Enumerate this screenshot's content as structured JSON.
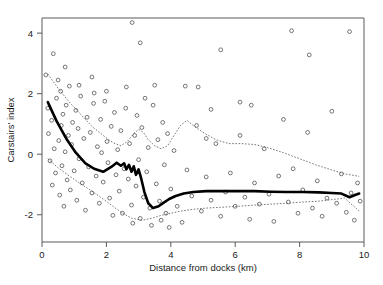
{
  "chart_data": {
    "type": "scatter",
    "title": "",
    "xlabel": "Distance from docks (km)",
    "ylabel": "Carstairs' index",
    "xlim": [
      0,
      10
    ],
    "ylim": [
      -2.9,
      4.5
    ],
    "xticks": [
      0,
      2,
      4,
      6,
      8,
      10
    ],
    "xtick_labels": [
      "0",
      "2",
      "4",
      "6",
      "8",
      "10"
    ],
    "yticks": [
      -2,
      0,
      2,
      4
    ],
    "ytick_labels": [
      "-2",
      "0",
      "2",
      "4"
    ],
    "grid": false,
    "legend": "none",
    "marker": "open-circle",
    "points": [
      [
        0.12,
        2.62
      ],
      [
        0.18,
        1.52
      ],
      [
        0.2,
        0.68
      ],
      [
        0.25,
        -0.22
      ],
      [
        0.3,
        1.12
      ],
      [
        0.32,
        -1.02
      ],
      [
        0.35,
        3.32
      ],
      [
        0.38,
        0.18
      ],
      [
        0.42,
        -0.62
      ],
      [
        0.45,
        1.85
      ],
      [
        0.5,
        2.45
      ],
      [
        0.52,
        0.45
      ],
      [
        0.55,
        -1.35
      ],
      [
        0.58,
        2.08
      ],
      [
        0.6,
        0.95
      ],
      [
        0.62,
        -0.38
      ],
      [
        0.65,
        1.32
      ],
      [
        0.68,
        -1.72
      ],
      [
        0.72,
        0.08
      ],
      [
        0.75,
        1.62
      ],
      [
        0.78,
        -0.85
      ],
      [
        0.82,
        0.62
      ],
      [
        0.85,
        2.25
      ],
      [
        0.88,
        -1.18
      ],
      [
        0.92,
        0.32
      ],
      [
        0.95,
        1.05
      ],
      [
        1.0,
        -0.55
      ],
      [
        1.05,
        1.45
      ],
      [
        1.08,
        -1.52
      ],
      [
        1.12,
        0.85
      ],
      [
        1.15,
        -0.15
      ],
      [
        1.2,
        1.92
      ],
      [
        1.25,
        -0.95
      ],
      [
        1.3,
        0.52
      ],
      [
        1.35,
        -1.85
      ],
      [
        1.4,
        1.22
      ],
      [
        1.45,
        -0.42
      ],
      [
        1.5,
        0.72
      ],
      [
        1.55,
        -1.28
      ],
      [
        1.6,
        1.68
      ],
      [
        1.62,
        2.02
      ],
      [
        1.68,
        -0.72
      ],
      [
        1.72,
        0.25
      ],
      [
        1.78,
        -1.62
      ],
      [
        1.82,
        1.15
      ],
      [
        1.85,
        0.05
      ],
      [
        1.9,
        -0.92
      ],
      [
        1.95,
        1.75
      ],
      [
        2.0,
        2.08
      ],
      [
        2.02,
        0.42
      ],
      [
        2.05,
        -0.28
      ],
      [
        2.1,
        -1.45
      ],
      [
        2.15,
        0.92
      ],
      [
        2.2,
        -2.02
      ],
      [
        2.25,
        1.38
      ],
      [
        2.3,
        -0.68
      ],
      [
        2.35,
        0.15
      ],
      [
        2.4,
        -1.22
      ],
      [
        2.45,
        0.78
      ],
      [
        2.5,
        -1.95
      ],
      [
        2.55,
        -0.48
      ],
      [
        2.6,
        1.52
      ],
      [
        2.62,
        2.22
      ],
      [
        2.68,
        -0.82
      ],
      [
        2.72,
        0.35
      ],
      [
        2.78,
        -1.68
      ],
      [
        2.82,
        -2.28
      ],
      [
        2.88,
        0.62
      ],
      [
        2.92,
        -1.05
      ],
      [
        2.95,
        1.28
      ],
      [
        3.0,
        -0.18
      ],
      [
        3.05,
        -2.12
      ],
      [
        3.1,
        0.88
      ],
      [
        3.15,
        -1.42
      ],
      [
        3.2,
        1.85
      ],
      [
        3.25,
        -0.58
      ],
      [
        3.3,
        0.22
      ],
      [
        3.35,
        -1.78
      ],
      [
        3.4,
        -2.35
      ],
      [
        3.45,
        1.62
      ],
      [
        3.5,
        2.28
      ],
      [
        3.55,
        -0.98
      ],
      [
        3.6,
        0.48
      ],
      [
        3.65,
        -1.55
      ],
      [
        3.7,
        -2.18
      ],
      [
        3.75,
        1.05
      ],
      [
        3.8,
        -0.35
      ],
      [
        3.85,
        -1.95
      ],
      [
        3.9,
        0.68
      ],
      [
        3.95,
        -2.42
      ],
      [
        4.0,
        -1.15
      ],
      [
        4.1,
        0.12
      ],
      [
        4.2,
        -1.72
      ],
      [
        4.35,
        -2.25
      ],
      [
        4.5,
        -0.52
      ],
      [
        4.65,
        -1.38
      ],
      [
        4.8,
        0.95
      ],
      [
        4.95,
        -1.88
      ],
      [
        5.1,
        -0.75
      ],
      [
        5.25,
        -1.52
      ],
      [
        5.4,
        0.35
      ],
      [
        5.55,
        -2.05
      ],
      [
        5.7,
        -1.25
      ],
      [
        5.85,
        -0.62
      ],
      [
        6.0,
        -1.72
      ],
      [
        6.15,
        0.62
      ],
      [
        6.3,
        -1.42
      ],
      [
        6.45,
        -2.15
      ],
      [
        6.5,
        1.62
      ],
      [
        6.6,
        -0.95
      ],
      [
        6.75,
        -1.65
      ],
      [
        6.9,
        0.18
      ],
      [
        7.05,
        -1.32
      ],
      [
        7.2,
        -2.22
      ],
      [
        7.35,
        -0.72
      ],
      [
        7.5,
        1.15
      ],
      [
        7.65,
        -1.58
      ],
      [
        7.8,
        -0.48
      ],
      [
        7.95,
        -1.95
      ],
      [
        8.1,
        -1.18
      ],
      [
        8.25,
        0.72
      ],
      [
        8.4,
        -1.78
      ],
      [
        8.55,
        -0.88
      ],
      [
        8.7,
        -2.05
      ],
      [
        8.85,
        -1.45
      ],
      [
        9.0,
        1.42
      ],
      [
        9.15,
        -1.62
      ],
      [
        9.3,
        -0.65
      ],
      [
        9.45,
        -1.92
      ],
      [
        9.55,
        4.05
      ],
      [
        9.6,
        -1.28
      ],
      [
        9.7,
        -2.18
      ],
      [
        9.8,
        -0.95
      ],
      [
        9.88,
        -1.55
      ],
      [
        2.8,
        4.35
      ],
      [
        3.05,
        3.68
      ],
      [
        5.55,
        3.45
      ],
      [
        7.75,
        4.08
      ],
      [
        8.3,
        3.28
      ],
      [
        4.45,
        2.25
      ],
      [
        4.85,
        2.22
      ],
      [
        6.15,
        1.72
      ],
      [
        5.25,
        1.48
      ],
      [
        5.1,
        0.52
      ],
      [
        1.55,
        2.55
      ],
      [
        1.15,
        2.28
      ],
      [
        0.72,
        2.88
      ]
    ],
    "series": [
      {
        "name": "fitted-smooth",
        "style": "thick-solid",
        "x": [
          0.18,
          0.45,
          0.75,
          1.05,
          1.35,
          1.62,
          1.9,
          2.15,
          2.32,
          2.45,
          2.55,
          2.62,
          2.7,
          2.78,
          2.85,
          2.92,
          3.0,
          3.08,
          3.18,
          3.3,
          3.45,
          3.62,
          3.78,
          3.95,
          4.15,
          4.4,
          4.7,
          5.1,
          5.6,
          6.1,
          6.6,
          7.1,
          7.6,
          8.1,
          8.6,
          9.0,
          9.3,
          9.55,
          9.72,
          9.85
        ],
        "y": [
          1.72,
          1.1,
          0.52,
          0.05,
          -0.3,
          -0.48,
          -0.58,
          -0.42,
          -0.28,
          -0.38,
          -0.3,
          -0.5,
          -0.35,
          -0.58,
          -0.4,
          -0.68,
          -0.5,
          -0.8,
          -1.25,
          -1.62,
          -1.78,
          -1.72,
          -1.6,
          -1.48,
          -1.38,
          -1.3,
          -1.25,
          -1.22,
          -1.22,
          -1.22,
          -1.22,
          -1.24,
          -1.25,
          -1.25,
          -1.26,
          -1.28,
          -1.3,
          -1.42,
          -1.35,
          -1.3
        ]
      },
      {
        "name": "upper-confidence-band",
        "style": "thin-dotted",
        "x": [
          0.18,
          0.5,
          0.85,
          1.2,
          1.55,
          1.9,
          2.2,
          2.45,
          2.65,
          2.85,
          3.0,
          3.15,
          3.3,
          3.5,
          3.7,
          3.9,
          4.1,
          4.3,
          4.5,
          4.7,
          5.0,
          5.4,
          5.8,
          6.2,
          6.6,
          7.0,
          7.5,
          8.0,
          8.5,
          9.0,
          9.4,
          9.85
        ],
        "y": [
          2.65,
          2.18,
          1.72,
          1.32,
          0.92,
          0.62,
          0.38,
          0.28,
          0.42,
          0.68,
          0.82,
          0.72,
          0.48,
          0.28,
          0.18,
          0.28,
          0.62,
          0.95,
          1.12,
          0.95,
          0.72,
          0.48,
          0.35,
          0.35,
          0.32,
          0.22,
          0.05,
          -0.15,
          -0.35,
          -0.52,
          -0.65,
          -0.73
        ]
      },
      {
        "name": "lower-confidence-band",
        "style": "thin-dotted",
        "x": [
          0.18,
          0.5,
          0.85,
          1.2,
          1.55,
          1.9,
          2.2,
          2.5,
          2.8,
          3.1,
          3.4,
          3.7,
          4.0,
          4.3,
          4.7,
          5.1,
          5.6,
          6.1,
          6.6,
          7.1,
          7.6,
          8.1,
          8.6,
          9.0,
          9.4,
          9.85
        ],
        "y": [
          -0.15,
          -0.45,
          -0.72,
          -0.98,
          -1.22,
          -1.48,
          -1.72,
          -1.95,
          -2.12,
          -2.18,
          -2.12,
          -2.02,
          -1.95,
          -1.88,
          -1.82,
          -1.78,
          -1.75,
          -1.72,
          -1.68,
          -1.65,
          -1.62,
          -1.58,
          -1.55,
          -1.5,
          -1.45,
          -1.88
        ]
      }
    ]
  }
}
